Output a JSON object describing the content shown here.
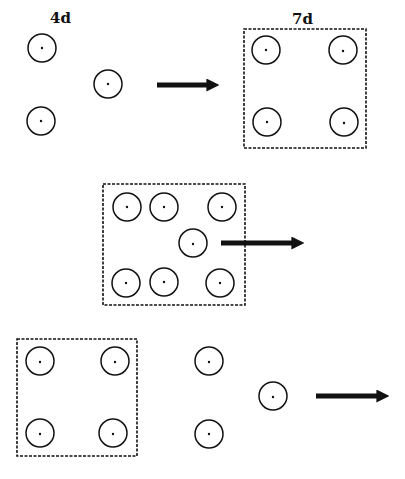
{
  "diagram": {
    "labels": {
      "first_stage": "4d",
      "second_stage": "7d"
    },
    "colors": {
      "stroke": "#111111",
      "background": "#ffffff"
    },
    "panels": [
      {
        "id": "panel-1",
        "description": "Three separate cells at 4d, arrow, four cells enclosed in a dashed box at 7d",
        "label_left": "4d",
        "label_right": "7d",
        "free_cells": 3,
        "boxed_cells": 4
      },
      {
        "id": "panel-2",
        "description": "Seven cells enclosed in a dashed box with an arrow pointing out from the central cell",
        "boxed_cells": 7
      },
      {
        "id": "panel-3",
        "description": "Four cells in a dashed box, three free cells, arrow pointing right",
        "boxed_cells": 4,
        "free_cells": 3
      }
    ]
  }
}
